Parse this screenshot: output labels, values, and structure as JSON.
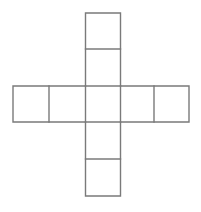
{
  "figure": {
    "title": "Cube net (cross-shaped hexomino)",
    "background_color": "#ffffff",
    "stroke_color": "#7a7a7a",
    "stroke_width": "1.4",
    "square_size": 36,
    "canvas": {
      "width": 201,
      "height": 212
    },
    "grid": {
      "x": [
        13,
        49,
        85.5,
        120.5,
        154,
        189
      ],
      "y": [
        13,
        49,
        86,
        122,
        159,
        196
      ]
    },
    "squares": [
      {
        "name": "top-square",
        "x": 85.5,
        "y": 13,
        "w": 35,
        "h": 36
      },
      {
        "name": "upper-middle-square",
        "x": 85.5,
        "y": 49,
        "w": 35,
        "h": 37
      },
      {
        "name": "left-square",
        "x": 13,
        "y": 86,
        "w": 36,
        "h": 36
      },
      {
        "name": "center-left-square",
        "x": 49,
        "y": 86,
        "w": 36.5,
        "h": 36
      },
      {
        "name": "center-square",
        "x": 85.5,
        "y": 86,
        "w": 35,
        "h": 36
      },
      {
        "name": "right-square",
        "x": 154,
        "y": 86,
        "w": 35,
        "h": 36
      },
      {
        "name": "lower-middle-square",
        "x": 85.5,
        "y": 122,
        "w": 35,
        "h": 37
      },
      {
        "name": "bottom-square",
        "x": 85.5,
        "y": 159,
        "w": 35,
        "h": 37
      }
    ],
    "outline_path": "M 85.5 13 L 120.5 13 L 120.5 86 L 189 86 L 189 122 L 120.5 122 L 120.5 196 L 85.5 196 L 85.5 122 L 13 122 L 13 86 L 85.5 86 Z",
    "internal_lines": [
      {
        "name": "divider-top",
        "x1": 85.5,
        "y1": 49,
        "x2": 120.5,
        "y2": 49
      },
      {
        "name": "divider-upper-center",
        "x1": 85.5,
        "y1": 86,
        "x2": 120.5,
        "y2": 86
      },
      {
        "name": "divider-lower-center",
        "x1": 85.5,
        "y1": 122,
        "x2": 120.5,
        "y2": 122
      },
      {
        "name": "divider-bottom",
        "x1": 85.5,
        "y1": 159,
        "x2": 120.5,
        "y2": 159
      },
      {
        "name": "divider-left",
        "x1": 49,
        "y1": 86,
        "x2": 49,
        "y2": 122
      },
      {
        "name": "divider-center-left",
        "x1": 85.5,
        "y1": 86,
        "x2": 85.5,
        "y2": 122
      },
      {
        "name": "divider-center-right",
        "x1": 120.5,
        "y1": 86,
        "x2": 120.5,
        "y2": 122
      },
      {
        "name": "divider-right",
        "x1": 154,
        "y1": 86,
        "x2": 154,
        "y2": 122
      }
    ]
  }
}
